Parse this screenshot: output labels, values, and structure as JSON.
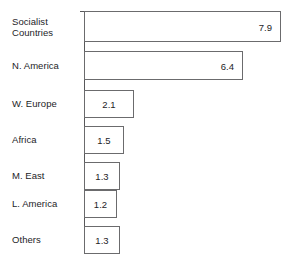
{
  "chart_data": {
    "type": "bar",
    "orientation": "horizontal",
    "title": "",
    "subtitle": "",
    "xlabel": "",
    "ylabel": "",
    "grid": false,
    "legend": false,
    "legend_position": "none",
    "axis_line": "vertical-left",
    "xlim": [
      0,
      7.9
    ],
    "categories": [
      "Socialist\nCountries",
      "N. America",
      "W. Europe",
      "Africa",
      "M. East",
      "L. America",
      "Others"
    ],
    "values": [
      7.9,
      6.4,
      2.1,
      1.5,
      1.3,
      1.2,
      1.3
    ],
    "value_labels": [
      "7.9",
      "6.4",
      "2.1",
      "1.5",
      "1.3",
      "1.2",
      "1.3"
    ],
    "colors": {
      "background": "#ffffff",
      "bar_fill": "#ffffff",
      "bar_outline": "#6b6b6d",
      "axis": "#58585a",
      "text": "#1d1d1f"
    },
    "bars": [
      {
        "category": "Socialist\nCountries",
        "value": 7.9,
        "label": "7.9",
        "label_align": "right",
        "top": 11,
        "height": 31,
        "width": 197
      },
      {
        "category": "N. America",
        "value": 6.4,
        "label": "6.4",
        "label_align": "right",
        "top": 51,
        "height": 29,
        "width": 159
      },
      {
        "category": "W. Europe",
        "value": 2.1,
        "label": "2.1",
        "label_align": "center",
        "top": 90,
        "height": 28,
        "width": 50
      },
      {
        "category": "Africa",
        "value": 1.5,
        "label": "1.5",
        "label_align": "center",
        "top": 126,
        "height": 28,
        "width": 40
      },
      {
        "category": "M. East",
        "value": 1.3,
        "label": "1.3",
        "label_align": "center",
        "top": 162,
        "height": 28,
        "width": 36
      },
      {
        "category": "L. America",
        "value": 1.2,
        "label": "1.2",
        "label_align": "center",
        "top": 190,
        "height": 28,
        "width": 33
      },
      {
        "category": "Others",
        "value": 1.3,
        "label": "1.3",
        "label_align": "center",
        "top": 226,
        "height": 28,
        "width": 36
      }
    ]
  }
}
